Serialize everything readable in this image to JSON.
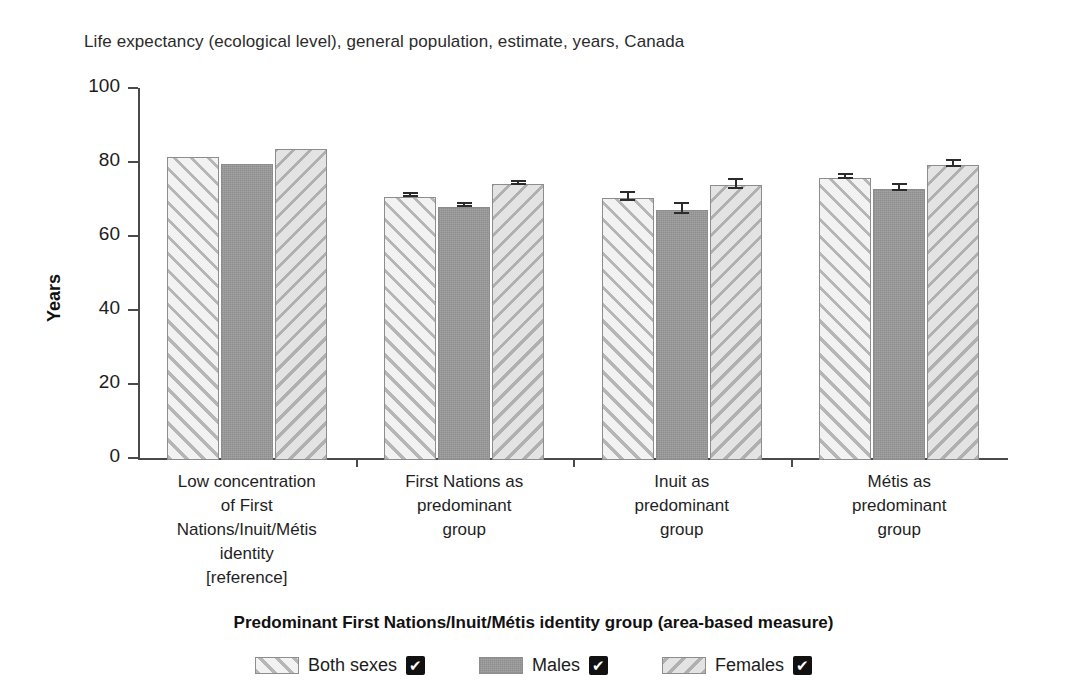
{
  "chart_data": {
    "type": "bar",
    "title": "Life expectancy (ecological level), general population, estimate, years, Canada",
    "xlabel": "Predominant First Nations/Inuit/Métis identity group (area-based measure)",
    "ylabel": "Years",
    "ylim": [
      0,
      100
    ],
    "yticks": [
      0,
      20,
      40,
      60,
      80,
      100
    ],
    "grid": false,
    "legend_position": "bottom",
    "categories": [
      "Low concentration of First Nations/Inuit/Métis identity [reference]",
      "First Nations as predominant group",
      "Inuit as predominant group",
      "Métis as predominant group"
    ],
    "category_lines": [
      [
        "Low concentration",
        "of First",
        "Nations/Inuit/Métis",
        "identity",
        "[reference]"
      ],
      [
        "First Nations as",
        "predominant",
        "group"
      ],
      [
        "Inuit as",
        "predominant",
        "group"
      ],
      [
        "Métis as",
        "predominant",
        "group"
      ]
    ],
    "series": [
      {
        "name": "Both sexes",
        "values": [
          82.0,
          71.1,
          70.8,
          76.2
        ],
        "errors": [
          0.0,
          0.4,
          1.1,
          0.6
        ]
      },
      {
        "name": "Males",
        "values": [
          80.1,
          68.5,
          67.5,
          73.3
        ],
        "errors": [
          0.0,
          0.4,
          1.4,
          0.8
        ]
      },
      {
        "name": "Females",
        "values": [
          84.0,
          74.5,
          74.2,
          79.7
        ],
        "errors": [
          0.0,
          0.5,
          1.3,
          0.9
        ]
      }
    ]
  },
  "legend": {
    "items": [
      {
        "label": "Both sexes",
        "check": "✔",
        "pattern": "hatch-up"
      },
      {
        "label": "Males",
        "check": "✔",
        "pattern": "solid-gray"
      },
      {
        "label": "Females",
        "check": "✔",
        "pattern": "hatch-down"
      }
    ]
  },
  "colors": {
    "both_sexes": "#f2f2f2",
    "males": "#9a9a9a",
    "females": "#e3e3e3",
    "axis": "#4a4a4a",
    "text": "#1c1c1c"
  }
}
